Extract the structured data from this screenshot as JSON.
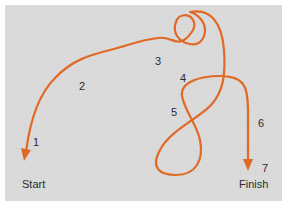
{
  "diagram": {
    "type": "route-path",
    "colors": {
      "background": "#d9d9d9",
      "border": "#ffffff",
      "path": "#e06a25",
      "text": "#2b2b2b"
    },
    "endpoints": {
      "start": "Start",
      "finish": "Finish"
    },
    "step_labels": [
      "1",
      "2",
      "3",
      "4",
      "5",
      "6",
      "7"
    ]
  }
}
